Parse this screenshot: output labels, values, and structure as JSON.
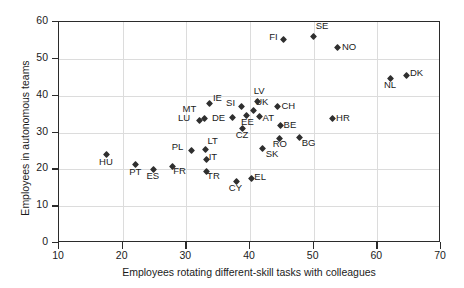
{
  "chart_data": {
    "type": "scatter",
    "title": "",
    "xlabel": "Employees rotating different-skill tasks with colleagues",
    "ylabel": "Employees in autonomous teams",
    "xlim": [
      10,
      70
    ],
    "ylim": [
      0,
      60
    ],
    "xticks": [
      10,
      20,
      30,
      40,
      50,
      60,
      70
    ],
    "yticks": [
      0,
      10,
      20,
      30,
      40,
      50,
      60
    ],
    "grid": true,
    "legend": "none",
    "marker": "diamond",
    "marker_color": "#2f2f2f",
    "points": [
      {
        "label": "HU",
        "x": 17.5,
        "y": 24.0,
        "lx": -4,
        "ly": 7
      },
      {
        "label": "PT",
        "x": 22.0,
        "y": 21.3,
        "lx": -4,
        "ly": 7
      },
      {
        "label": "ES",
        "x": 24.8,
        "y": 20.0,
        "lx": -4,
        "ly": 7
      },
      {
        "label": "FR",
        "x": 27.8,
        "y": 20.9,
        "lx": 1,
        "ly": 5
      },
      {
        "label": "PL",
        "x": 30.8,
        "y": 25.0,
        "lx": -18,
        "ly": -4
      },
      {
        "label": "LU",
        "x": 32.0,
        "y": 33.3,
        "lx": -19,
        "ly": -2
      },
      {
        "label": "MT",
        "x": 32.8,
        "y": 33.8,
        "lx": -18,
        "ly": -10
      },
      {
        "label": "IE",
        "x": 33.7,
        "y": 38.0,
        "lx": 3,
        "ly": -5
      },
      {
        "label": "LT",
        "x": 33.0,
        "y": 25.3,
        "lx": 2,
        "ly": -9
      },
      {
        "label": "IT",
        "x": 33.2,
        "y": 22.6,
        "lx": 2,
        "ly": -3
      },
      {
        "label": "TR",
        "x": 33.1,
        "y": 19.3,
        "lx": 1,
        "ly": 4
      },
      {
        "label": "CY",
        "x": 37.8,
        "y": 16.8,
        "lx": -4,
        "ly": 7
      },
      {
        "label": "EL",
        "x": 40.2,
        "y": 17.6,
        "lx": 3,
        "ly": -1
      },
      {
        "label": "DE",
        "x": 37.2,
        "y": 34.1,
        "lx": -17,
        "ly": 1
      },
      {
        "label": "CZ",
        "x": 38.8,
        "y": 31.2,
        "lx": -4,
        "ly": 7
      },
      {
        "label": "SI",
        "x": 38.6,
        "y": 37.0,
        "lx": -16,
        "ly": -4
      },
      {
        "label": "EE",
        "x": 39.5,
        "y": 34.5,
        "lx": -3,
        "ly": 6
      },
      {
        "label": "UK",
        "x": 40.5,
        "y": 36.1,
        "lx": 2,
        "ly": -8
      },
      {
        "label": "LV",
        "x": 41.2,
        "y": 38.4,
        "lx": -3,
        "ly": -11
      },
      {
        "label": "AT",
        "x": 41.5,
        "y": 34.4,
        "lx": 3,
        "ly": 2
      },
      {
        "label": "SK",
        "x": 42.0,
        "y": 25.6,
        "lx": 3,
        "ly": 5
      },
      {
        "label": "FI",
        "x": 45.3,
        "y": 55.2,
        "lx": -16,
        "ly": -3
      },
      {
        "label": "BE",
        "x": 44.8,
        "y": 32.0,
        "lx": 3,
        "ly": 0
      },
      {
        "label": "RO",
        "x": 44.7,
        "y": 28.5,
        "lx": -3,
        "ly": 6
      },
      {
        "label": "CH",
        "x": 44.3,
        "y": 37.0,
        "lx": 4,
        "ly": -1
      },
      {
        "label": "BG",
        "x": 47.8,
        "y": 28.6,
        "lx": 2,
        "ly": 5
      },
      {
        "label": "SE",
        "x": 50.0,
        "y": 56.2,
        "lx": 2,
        "ly": -10
      },
      {
        "label": "NO",
        "x": 53.8,
        "y": 53.0,
        "lx": 4,
        "ly": -1
      },
      {
        "label": "HR",
        "x": 52.9,
        "y": 33.8,
        "lx": 4,
        "ly": -1
      },
      {
        "label": "NL",
        "x": 62.0,
        "y": 44.8,
        "lx": -4,
        "ly": 7
      },
      {
        "label": "DK",
        "x": 64.5,
        "y": 45.6,
        "lx": 4,
        "ly": -2
      }
    ]
  }
}
